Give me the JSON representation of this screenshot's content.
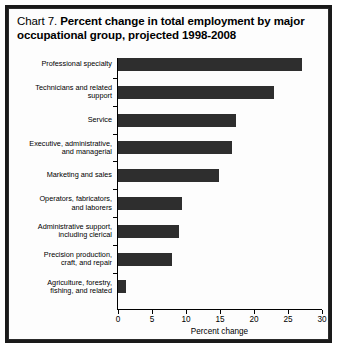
{
  "title": {
    "prefix": "Chart 7.",
    "main": "Percent change in total employment by major occupational group, projected 1998-2008"
  },
  "chart_data": {
    "type": "bar",
    "orientation": "horizontal",
    "title": "Chart 7.  Percent change in total employment by major occupational group, projected 1998-2008",
    "xlabel": "Percent change",
    "ylabel": "",
    "xlim": [
      0,
      30
    ],
    "xticks": [
      0,
      5,
      10,
      15,
      20,
      25,
      30
    ],
    "xtick_labels": [
      "0",
      "5",
      "10",
      "15",
      "20",
      "25",
      "30"
    ],
    "grid": false,
    "legend": false,
    "bar_color": "#2e2e2e",
    "categories": [
      "Professional specialty",
      "Technicians and related support",
      "Service",
      "Executive, administrative, and managerial",
      "Marketing and sales",
      "Operators, fabricators, and laborers",
      "Administrative support, including clerical",
      "Precision production, craft, and repair",
      "Agriculture, forestry, fishing, and related"
    ],
    "category_label_lines": [
      [
        "Professional specialty"
      ],
      [
        "Technicians and related",
        "support"
      ],
      [
        "Service"
      ],
      [
        "Executive, administrative,",
        "and managerial"
      ],
      [
        "Marketing and sales"
      ],
      [
        "Operators, fabricators,",
        "and laborers"
      ],
      [
        "Administrative support,",
        "including clerical"
      ],
      [
        "Precision production,",
        "craft, and repair"
      ],
      [
        "Agriculture, forestry,",
        "fishing, and related"
      ]
    ],
    "values": [
      27.0,
      23.0,
      17.4,
      16.7,
      14.8,
      9.4,
      8.9,
      8.0,
      1.2
    ]
  }
}
